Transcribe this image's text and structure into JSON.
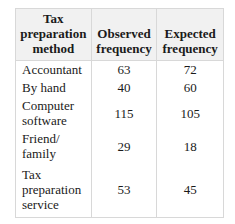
{
  "table": {
    "headers": [
      "Tax\npreparation\nmethod",
      "Observed\nfrequency",
      "Expected\nfrequency"
    ],
    "rows": [
      {
        "method": "Accountant",
        "observed": "63",
        "expected": "72"
      },
      {
        "method": "By hand",
        "observed": "40",
        "expected": "60"
      },
      {
        "method": "Computer\nsoftware",
        "observed": "115",
        "expected": "105"
      },
      {
        "method": "Friend/\nfamily",
        "observed": "29",
        "expected": "18"
      },
      {
        "method": "Tax\npreparation\nservice",
        "observed": "53",
        "expected": "45"
      }
    ]
  }
}
